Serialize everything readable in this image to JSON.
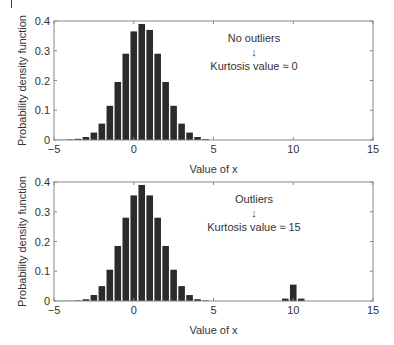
{
  "chart_data": [
    {
      "type": "bar",
      "title": "",
      "xlabel": "Value of x",
      "ylabel": "Probability density function",
      "xlim": [
        -5,
        15
      ],
      "ylim": [
        0,
        0.4
      ],
      "xticks": [
        -5,
        0,
        5,
        10,
        15
      ],
      "yticks": [
        0,
        0.1,
        0.2,
        0.3,
        0.4
      ],
      "ytick_labels": [
        "0",
        "0.1",
        "0.2",
        "0.3",
        "0.4"
      ],
      "grid": false,
      "bin_width": 0.5,
      "annotation": {
        "line1": "No outliers",
        "arrow": "↓",
        "line2": "Kurtosis value ≈ 0"
      },
      "x": [
        -4.5,
        -4,
        -3.5,
        -3,
        -2.5,
        -2,
        -1.5,
        -1,
        -0.5,
        0,
        0.5,
        1,
        1.5,
        2,
        2.5,
        3,
        3.5,
        4,
        4.5
      ],
      "values": [
        0.001,
        0.002,
        0.004,
        0.01,
        0.025,
        0.055,
        0.115,
        0.195,
        0.29,
        0.365,
        0.39,
        0.37,
        0.29,
        0.195,
        0.115,
        0.055,
        0.025,
        0.01,
        0.003
      ]
    },
    {
      "type": "bar",
      "title": "",
      "xlabel": "Value of x",
      "ylabel": "Probability density function",
      "xlim": [
        -5,
        15
      ],
      "ylim": [
        0,
        0.4
      ],
      "xticks": [
        -5,
        0,
        5,
        10,
        15
      ],
      "yticks": [
        0,
        0.1,
        0.2,
        0.3,
        0.4
      ],
      "ytick_labels": [
        "0",
        "0.1",
        "0.2",
        "0.3",
        "0.4"
      ],
      "grid": false,
      "bin_width": 0.5,
      "annotation": {
        "line1": "Outliers",
        "arrow": "↓",
        "line2": "Kurtosis value ≈ 15"
      },
      "x": [
        -4.5,
        -4,
        -3.5,
        -3,
        -2.5,
        -2,
        -1.5,
        -1,
        -0.5,
        0,
        0.5,
        1,
        1.5,
        2,
        2.5,
        3,
        3.5,
        4,
        4.5,
        9.5,
        10,
        10.5
      ],
      "values": [
        0.001,
        0.001,
        0.002,
        0.006,
        0.02,
        0.05,
        0.105,
        0.185,
        0.28,
        0.355,
        0.39,
        0.355,
        0.28,
        0.185,
        0.105,
        0.05,
        0.02,
        0.006,
        0.002,
        0.008,
        0.055,
        0.008
      ]
    }
  ]
}
